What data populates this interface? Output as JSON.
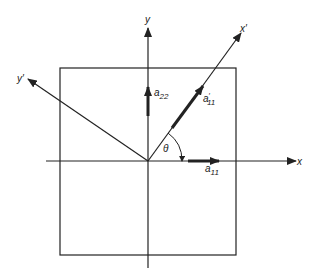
{
  "diagram": {
    "axes": {
      "x_label": "x",
      "y_label": "y",
      "x_prime_label": "x′",
      "y_prime_label": "y′"
    },
    "vectors": {
      "a11": {
        "base": "a",
        "sub": "11"
      },
      "a22": {
        "base": "a",
        "sub": "22"
      },
      "a11_prime": {
        "base": "a",
        "sup": "′",
        "sub": "11"
      }
    },
    "angle_label": "θ",
    "colors": {
      "stroke": "#222222",
      "background": "#ffffff"
    }
  }
}
